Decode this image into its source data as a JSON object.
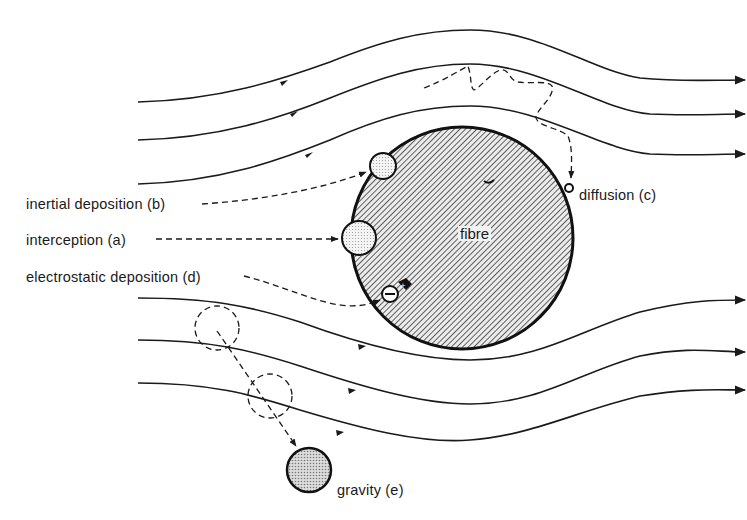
{
  "diagram": {
    "fibre": {
      "label": "fibre",
      "cx": 462,
      "cy": 238,
      "r": 111,
      "fill_pattern": "diagonal-hatch"
    },
    "mechanisms": [
      {
        "id": "b",
        "label": "inertial deposition (b)",
        "particle": "dotted-sphere-small"
      },
      {
        "id": "a",
        "label": "interception (a)",
        "particle": "dotted-sphere-large"
      },
      {
        "id": "d",
        "label": "electrostatic deposition (d)",
        "particle": "negative-charged-sphere"
      },
      {
        "id": "c",
        "label": "diffusion (c)",
        "particle": "tiny-sphere"
      },
      {
        "id": "e",
        "label": "gravity (e)",
        "particle": "dark-dotted-sphere"
      }
    ],
    "streamlines": {
      "above_count": 3,
      "below_count": 3,
      "direction": "left-to-right"
    },
    "colors": {
      "ink": "#1a1a1a",
      "hatch_bg": "#e8e8e8",
      "particle_fill": "#d9d9d9",
      "background": "#ffffff"
    },
    "charge_symbol": "−"
  }
}
